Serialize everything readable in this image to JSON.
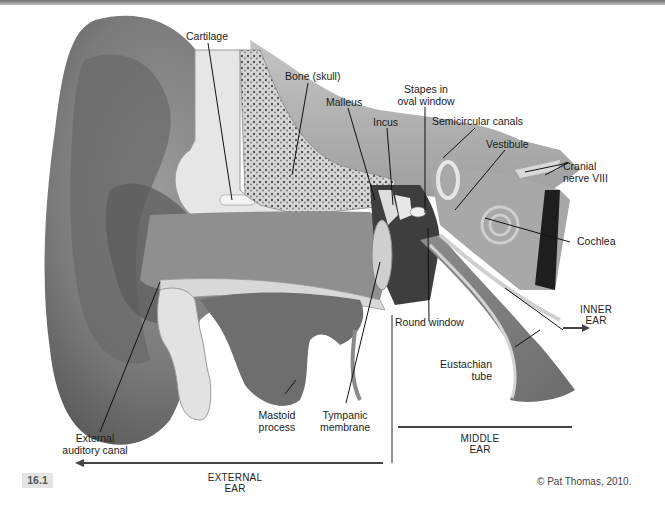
{
  "figure": {
    "number": "16.1",
    "credit": "© Pat Thomas, 2010.",
    "colors": {
      "background": "#ffffff",
      "skin_dark": "#5e5e5e",
      "skin_mid": "#8a8a8a",
      "skin_light": "#b5b5b5",
      "bone": "#dcdcdc",
      "canal": "#9a9a9a",
      "leader_line": "#111111",
      "badge_bg": "#e4e4e4"
    }
  },
  "labels": {
    "cartilage": "Cartilage",
    "bone_skull": "Bone (skull)",
    "malleus": "Malleus",
    "incus": "Incus",
    "stapes_line1": "Stapes in",
    "stapes_line2": "oval window",
    "semicircular_canals": "Semicircular canals",
    "vestibule": "Vestibule",
    "cranial_nerve_line1": "Cranial",
    "cranial_nerve_line2": "nerve VIII",
    "cochlea": "Cochlea",
    "round_window": "Round window",
    "eustachian_line1": "Eustachian",
    "eustachian_line2": "tube",
    "mastoid_line1": "Mastoid",
    "mastoid_line2": "process",
    "tympanic_line1": "Tympanic",
    "tympanic_line2": "membrane",
    "ext_canal_line1": "External",
    "ext_canal_line2": "auditory canal"
  },
  "regions": {
    "external_line1": "EXTERNAL",
    "external_line2": "EAR",
    "middle_line1": "MIDDLE",
    "middle_line2": "EAR",
    "inner_line1": "INNER",
    "inner_line2": "EAR"
  }
}
